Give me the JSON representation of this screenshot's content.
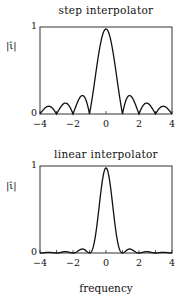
{
  "chart_data": [
    {
      "type": "line",
      "title": "step interpolator",
      "xlabel": "",
      "ylabel": "|ι̂|",
      "xlim": [
        -4,
        4
      ],
      "ylim": [
        0,
        1
      ],
      "xticks": [
        "-4",
        "-2",
        "0",
        "2",
        "4"
      ],
      "yticks": [
        "0",
        "1"
      ],
      "grid": false,
      "function": "|sinc(f)|",
      "x": [
        -4,
        -3.5,
        -3,
        -2.5,
        -2,
        -1.5,
        -1,
        -0.5,
        0,
        0.5,
        1,
        1.5,
        2,
        2.5,
        3,
        3.5,
        4
      ],
      "values": [
        0,
        0.09,
        0,
        0.13,
        0,
        0.21,
        0,
        0.64,
        1,
        0.64,
        0,
        0.21,
        0,
        0.13,
        0,
        0.09,
        0
      ]
    },
    {
      "type": "line",
      "title": "linear interpolator",
      "xlabel": "frequency",
      "ylabel": "|ι̂|",
      "xlim": [
        -4,
        4
      ],
      "ylim": [
        0,
        1
      ],
      "xticks": [
        "-4",
        "-2",
        "0",
        "2",
        "4"
      ],
      "yticks": [
        "0",
        "1"
      ],
      "grid": false,
      "function": "sinc(f)^2",
      "x": [
        -4,
        -3.5,
        -3,
        -2.5,
        -2,
        -1.5,
        -1,
        -0.5,
        0,
        0.5,
        1,
        1.5,
        2,
        2.5,
        3,
        3.5,
        4
      ],
      "values": [
        0,
        0.008,
        0,
        0.016,
        0,
        0.045,
        0,
        0.405,
        1,
        0.405,
        0,
        0.045,
        0,
        0.016,
        0,
        0.008,
        0
      ]
    }
  ],
  "labels": {
    "top_title": "step interpolator",
    "bottom_title": "linear interpolator",
    "ylabel": "|ι̂|",
    "xlabel": "frequency",
    "xticks": [
      "−4",
      "−2",
      "0",
      "2",
      "4"
    ],
    "y0": "0",
    "y1": "1"
  }
}
